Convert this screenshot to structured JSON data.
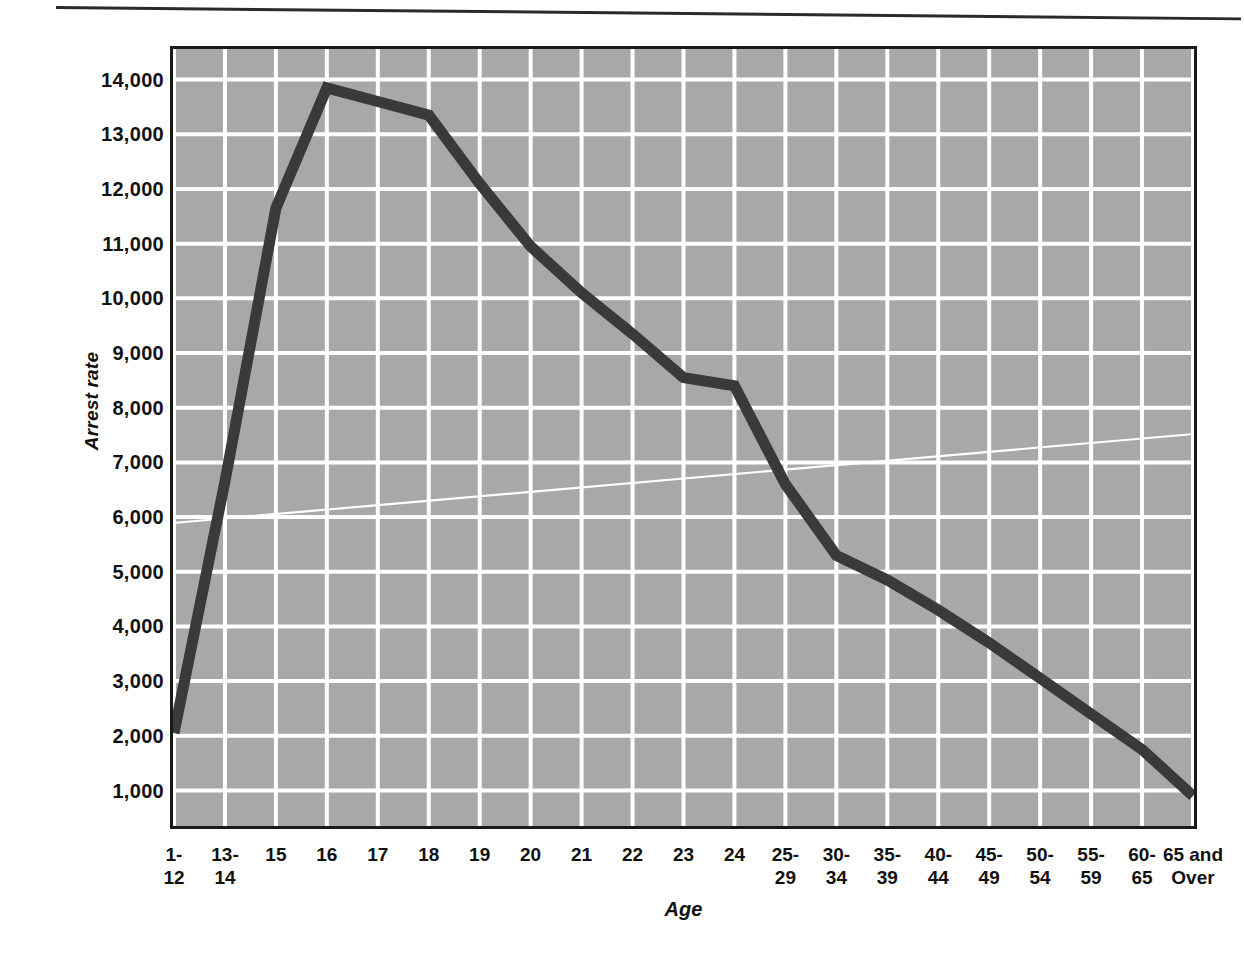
{
  "figure": {
    "background_color": "#ffffff",
    "plot_background_color": "#a8a8a8",
    "gridline_color": "#ffffff",
    "series_color": "#3a3a3a",
    "frame_color": "#1a1a1a"
  },
  "chart_data": {
    "type": "line",
    "title": "",
    "xlabel": "Age",
    "ylabel": "Arrest rate",
    "categories": [
      "1-\n12",
      "13-\n14",
      "15",
      "16",
      "17",
      "18",
      "19",
      "20",
      "21",
      "22",
      "23",
      "24",
      "25-\n29",
      "30-\n34",
      "35-\n39",
      "40-\n44",
      "45-\n49",
      "50-\n54",
      "55-\n59",
      "60-\n65",
      "65 and\nOver"
    ],
    "category_labels": [
      {
        "line1": "1-",
        "line2": "12"
      },
      {
        "line1": "13-",
        "line2": "14"
      },
      {
        "line1": "15",
        "line2": ""
      },
      {
        "line1": "16",
        "line2": ""
      },
      {
        "line1": "17",
        "line2": ""
      },
      {
        "line1": "18",
        "line2": ""
      },
      {
        "line1": "19",
        "line2": ""
      },
      {
        "line1": "20",
        "line2": ""
      },
      {
        "line1": "21",
        "line2": ""
      },
      {
        "line1": "22",
        "line2": ""
      },
      {
        "line1": "23",
        "line2": ""
      },
      {
        "line1": "24",
        "line2": ""
      },
      {
        "line1": "25-",
        "line2": "29"
      },
      {
        "line1": "30-",
        "line2": "34"
      },
      {
        "line1": "35-",
        "line2": "39"
      },
      {
        "line1": "40-",
        "line2": "44"
      },
      {
        "line1": "45-",
        "line2": "49"
      },
      {
        "line1": "50-",
        "line2": "54"
      },
      {
        "line1": "55-",
        "line2": "59"
      },
      {
        "line1": "60-",
        "line2": "65"
      },
      {
        "line1": "65 and",
        "line2": "Over"
      }
    ],
    "values": [
      2050,
      6650,
      11650,
      13850,
      13600,
      13350,
      12100,
      10950,
      10100,
      9350,
      8550,
      8400,
      6600,
      5300,
      4850,
      4300,
      3700,
      3050,
      2400,
      1750,
      900
    ],
    "ylim": [
      350,
      14560
    ],
    "yticks": [
      1000,
      2000,
      3000,
      4000,
      5000,
      6000,
      7000,
      8000,
      9000,
      10000,
      11000,
      12000,
      13000,
      14000
    ],
    "ytick_labels": [
      "1,000",
      "2,000",
      "3,000",
      "4,000",
      "5,000",
      "6,000",
      "7,000",
      "8,000",
      "9,000",
      "10,000",
      "11,000",
      "12,000",
      "13,000",
      "14,000"
    ],
    "grid": true,
    "legend": null,
    "annotations": []
  }
}
